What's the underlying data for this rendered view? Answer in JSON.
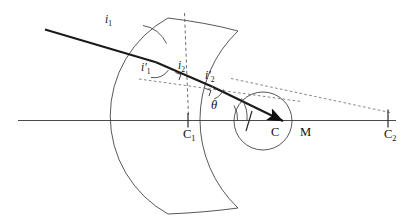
{
  "figure": {
    "domain": "optics-ray-diagram",
    "background_color": "#ffffff",
    "ink_color": "#1a1a1a",
    "width": 410,
    "height": 221
  },
  "labels": {
    "incidence_angle_1": {
      "base": "i",
      "sub": "1",
      "prime": false,
      "text": "i1"
    },
    "refraction_angle_1": {
      "base": "i",
      "sub": "1",
      "prime": true,
      "text": "i'1"
    },
    "incidence_angle_2": {
      "base": "i",
      "sub": "2",
      "prime": false,
      "text": "i2"
    },
    "refraction_angle_2": {
      "base": "i",
      "sub": "2",
      "prime": true,
      "text": "i'2"
    },
    "deviation_angle": {
      "base": "θ",
      "sub": "",
      "prime": false,
      "text": "θ"
    },
    "center_1": {
      "base": "C",
      "sub": "1",
      "prime": false,
      "text": "C1"
    },
    "center_sphere": {
      "base": "C",
      "sub": "",
      "prime": false,
      "text": "C"
    },
    "point_m": {
      "base": "M",
      "sub": "",
      "prime": false,
      "text": "M"
    },
    "center_2": {
      "base": "C",
      "sub": "2",
      "prime": false,
      "text": "C2"
    }
  },
  "geometry": {
    "optical_axis": {
      "x1": 18,
      "y1": 120.5,
      "x2": 396,
      "y2": 120.5
    },
    "surface_1_arc": "M 168 18 A 112 112 0 0 0 168 214",
    "surface_2_arc": "M 238 31 A 122 122 0 0 0 238 208",
    "lens_cap_top": "M 168 18 L 238 31",
    "lens_cap_bottom": "M 168 214 L 238 208",
    "sphere_circle": {
      "cx": 263,
      "cy": 121,
      "r": 29
    },
    "ray_incident": {
      "x1": 45,
      "y1": 29.5,
      "x2": 155.5,
      "y2": 62
    },
    "ray_inside": {
      "x1": 155.5,
      "y1": 62,
      "x2": 212,
      "y2": 86.5
    },
    "ray_exit": {
      "x1": 212,
      "y1": 86.5,
      "x2": 286,
      "y2": 122.5
    },
    "normal_1_dash": {
      "x1": 184,
      "y1": 14,
      "x2": 188,
      "y2": 115
    },
    "normal_2_dash": {
      "x1": 140,
      "y1": 79.5,
      "x2": 300,
      "y2": 101
    },
    "chord_dash": {
      "x1": 232,
      "y1": 79,
      "x2": 390,
      "y2": 112
    },
    "tick_c1": {
      "x": 188,
      "y1": 113.5,
      "y2": 127
    },
    "tick_c2": {
      "x": 388,
      "y1": 110,
      "y2": 127
    },
    "radius_tick_sphere": {
      "x1": 252,
      "y1": 112,
      "x2": 246,
      "y2": 131
    }
  },
  "arcs": {
    "angle_arc_i1": "M 165 42 A 30 30 0 0 0 142.5 24.5",
    "angle_arc_i1_prime": "M 152.5 76 A 17 17 0 0 0 168 69.5",
    "angle_arc_i2_prime": "M 216.5 98 A 16 16 0 0 0 224.5 89.5",
    "angle_arc_theta": "M 238 120.5 A 26 26 0 0 0 235 105",
    "angle_arc_theta2": "M 248 120.5 A 36 36 0 0 0 242.5 98"
  },
  "marks": {
    "right_angle_1": "M 176 72.5 L 181 74.5 L 179 79.5",
    "right_angle_2": "M 206 89 L 211 91 L 209 95.5"
  }
}
